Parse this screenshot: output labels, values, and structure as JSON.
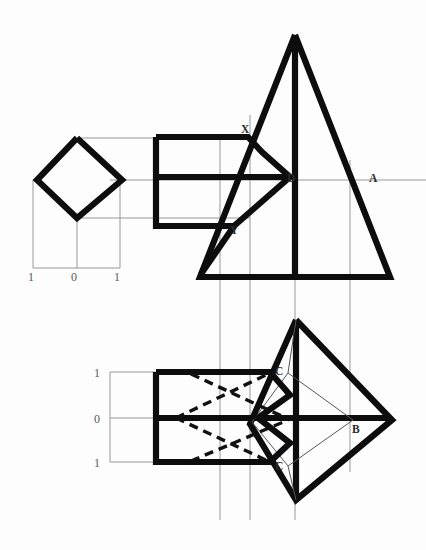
{
  "drawing": {
    "title": "Orthographic projection: pyramid with rectangular prism intersection",
    "background_color": "#fdfdfd",
    "ink_color": "#0d0d0d",
    "construction_color": "#8d8d8d",
    "hidden_line_color": "#111111"
  },
  "labels": {
    "front_view": [
      {
        "text": "X",
        "x": 243,
        "y": 133
      },
      {
        "text": "D",
        "x": 287,
        "y": 182
      },
      {
        "text": "A",
        "x": 371,
        "y": 182
      },
      {
        "text": "Y",
        "x": 232,
        "y": 233
      }
    ],
    "plan_view": [
      {
        "text": "C",
        "x": 277,
        "y": 374
      },
      {
        "text": "B",
        "x": 355,
        "y": 432
      },
      {
        "text": "C",
        "x": 277,
        "y": 469
      }
    ]
  },
  "scales": {
    "horizontal": {
      "orientation": "horizontal",
      "ticks": [
        {
          "label": "1",
          "x": 31,
          "y": 278
        },
        {
          "label": "0",
          "x": 74,
          "y": 278
        },
        {
          "label": "1",
          "x": 117,
          "y": 278
        }
      ],
      "axis_y": 268,
      "axis_x_start": 33,
      "axis_x_end": 120
    },
    "vertical": {
      "orientation": "vertical",
      "ticks": [
        {
          "label": "1",
          "x": 97,
          "y": 378
        },
        {
          "label": "0",
          "x": 97,
          "y": 423
        },
        {
          "label": "1",
          "x": 97,
          "y": 467
        }
      ],
      "axis_x": 110,
      "axis_y_start": 372,
      "axis_y_end": 462
    }
  },
  "geometry": {
    "side_view_diamond": {
      "points": "77,138 122,180 77,218 37,180 77,138"
    },
    "front_view_profile": {
      "outline": "153,137 246,137 260,152 288,177 232,226 153,226 153,137",
      "mid_rail": "153,177 288,177",
      "lower_box_left": "153,177 153,226"
    },
    "front_view_triangle": {
      "outline": "295,35 390,277 200,277 295,35",
      "axis": "295,35 295,277"
    },
    "front_view_lower_wedge": {
      "path": "232,226 200,277"
    },
    "plan_view_diamond": {
      "points": "296,320 390,420 296,500 255,423 296,320"
    },
    "plan_view_profile": {
      "outline": "153,372 268,372 288,395 258,418 288,443 268,462 153,462 153,372",
      "mid_rail": "153,418 390,418",
      "axis_vertical": "296,320 296,500"
    },
    "plan_inner_quad": {
      "points": "288,373 355,420 288,466 255,420 288,373"
    },
    "hidden_lines": [
      "176,418 268,373",
      "190,373 288,420",
      "176,418 268,462",
      "190,462 288,420"
    ],
    "projection_lines_vertical": [
      {
        "x": 220,
        "y1": 140,
        "y2": 520
      },
      {
        "x": 250,
        "y1": 115,
        "y2": 520
      },
      {
        "x": 295,
        "y1": 100,
        "y2": 520
      },
      {
        "x": 350,
        "y1": 160,
        "y2": 470
      }
    ],
    "projection_lines_horizontal": [
      {
        "y": 138,
        "x1": 80,
        "x2": 250
      },
      {
        "y": 180,
        "x1": 110,
        "x2": 426
      },
      {
        "y": 218,
        "x1": 80,
        "x2": 250
      },
      {
        "y": 372,
        "x1": 110,
        "x2": 160
      },
      {
        "y": 418,
        "x1": 110,
        "x2": 160
      },
      {
        "y": 462,
        "x1": 110,
        "x2": 160
      }
    ]
  }
}
